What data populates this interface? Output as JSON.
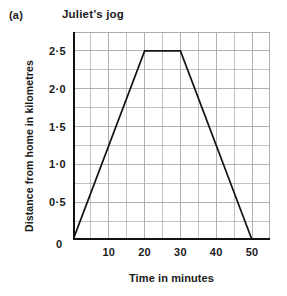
{
  "figure": {
    "part_label": "(a)",
    "title": "Juliet’s jog"
  },
  "chart_data": {
    "type": "line",
    "title": "Juliet’s jog",
    "xlabel": "Time in minutes",
    "ylabel": "Distance from home in kilometres",
    "xlim": [
      0,
      55
    ],
    "ylim": [
      0,
      2.75
    ],
    "grid": true,
    "legend": "none",
    "x_major_ticks": [
      10,
      20,
      30,
      40,
      50
    ],
    "x_major_tick_labels": [
      "10",
      "20",
      "30",
      "40",
      "50"
    ],
    "x_minor_step": 5,
    "y_major_ticks": [
      0,
      0.5,
      1.0,
      1.5,
      2.0,
      2.5
    ],
    "y_major_tick_labels": [
      "0",
      "0·5",
      "1·0",
      "1·5",
      "2·0",
      "2·5"
    ],
    "y_minor_step": 0.25,
    "origin_label": "0",
    "series": [
      {
        "name": "Juliet’s jog",
        "color": "#141414",
        "x": [
          0,
          20,
          30,
          50
        ],
        "y": [
          0,
          2.5,
          2.5,
          0
        ]
      }
    ]
  },
  "style": {
    "grid_color": "#a8a8a8",
    "axis_color": "#111111",
    "line_color": "#141414",
    "background": "#ffffff"
  }
}
